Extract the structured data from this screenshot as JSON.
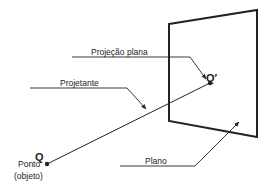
{
  "diagram": {
    "colors": {
      "stroke": "#222222",
      "background": "#ffffff"
    },
    "labels": {
      "projection_label": "Projeção plana",
      "projector_label": "Projetante",
      "plane_label": "Plano",
      "point_symbol": "Q",
      "projected_point_symbol": "Q′",
      "point_label_line1": "Ponto",
      "point_label_line2": "(objeto)"
    },
    "elements": [
      {
        "id": "plane",
        "type": "quadrilateral",
        "label": "Plano"
      },
      {
        "id": "point-Q",
        "type": "point",
        "label": "Q",
        "caption": "Ponto (objeto)"
      },
      {
        "id": "point-Q-prime",
        "type": "point",
        "label": "Q′",
        "caption": "Projeção plana"
      },
      {
        "id": "projector",
        "type": "line",
        "from": "Q",
        "to": "Q′",
        "label": "Projetante"
      }
    ]
  }
}
